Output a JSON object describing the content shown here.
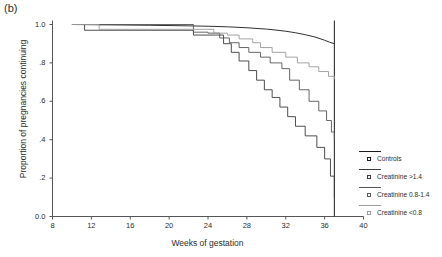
{
  "panel": {
    "label": "(b)"
  },
  "chart_data": {
    "type": "line",
    "title": "",
    "subtitle": "",
    "xlabel": "Weeks of gestation",
    "ylabel": "Proportion of pregnancies continuing",
    "xlim": [
      8,
      40
    ],
    "ylim": [
      0.0,
      1.0
    ],
    "xticks": [
      8,
      12,
      16,
      20,
      24,
      28,
      32,
      36,
      40
    ],
    "xticklabels": [
      "8",
      "12",
      "16",
      "20",
      "24",
      "28",
      "32",
      "36",
      "40"
    ],
    "yticks": [
      0.0,
      0.2,
      0.4,
      0.6,
      0.8,
      1.0
    ],
    "yticklabels": [
      "0.0",
      ".2",
      ".4",
      ".6",
      ".8",
      "1.0"
    ],
    "grid": false,
    "legend_position": "right",
    "annotations": [
      {
        "type": "vline",
        "x": 37.0,
        "label": "term reference line"
      }
    ],
    "series": [
      {
        "name": "Controls",
        "color": "#1a1a1a",
        "style": "smooth-step",
        "x": [
          10.0,
          14.0,
          18.0,
          22.0,
          24.0,
          26.0,
          28.0,
          30.0,
          31.0,
          32.0,
          33.0,
          34.0,
          35.0,
          36.0,
          36.5,
          37.0
        ],
        "y": [
          1.0,
          0.998,
          0.996,
          0.993,
          0.991,
          0.988,
          0.983,
          0.976,
          0.971,
          0.965,
          0.957,
          0.947,
          0.935,
          0.918,
          0.908,
          0.9
        ]
      },
      {
        "name": "Creatinine >1.4",
        "color": "#3a3a3a",
        "style": "step",
        "x": [
          10.0,
          11.3,
          20.0,
          22.5,
          24.8,
          25.6,
          26.4,
          27.2,
          28.2,
          29.0,
          29.8,
          30.6,
          31.4,
          32.2,
          33.0,
          34.0,
          35.2,
          36.0,
          36.6,
          37.0
        ],
        "y": [
          1.0,
          0.97,
          0.97,
          0.945,
          0.945,
          0.9,
          0.855,
          0.81,
          0.76,
          0.71,
          0.66,
          0.62,
          0.57,
          0.52,
          0.47,
          0.42,
          0.36,
          0.3,
          0.21,
          0.1
        ]
      },
      {
        "name": "Creatinine 0.8-1.4",
        "color": "#555555",
        "style": "step",
        "x": [
          10.0,
          20.5,
          22.5,
          24.0,
          25.2,
          26.2,
          27.2,
          28.2,
          29.4,
          30.4,
          31.6,
          32.4,
          33.4,
          34.4,
          35.4,
          36.2,
          36.7,
          37.0
        ],
        "y": [
          1.0,
          1.0,
          0.96,
          0.955,
          0.93,
          0.905,
          0.88,
          0.855,
          0.83,
          0.8,
          0.77,
          0.71,
          0.66,
          0.6,
          0.55,
          0.5,
          0.44,
          0.4
        ]
      },
      {
        "name": "Creatinine <0.8",
        "color": "#9a9a9a",
        "style": "step",
        "x": [
          10.0,
          12.8,
          22.2,
          24.6,
          26.0,
          27.2,
          28.6,
          29.4,
          30.6,
          32.0,
          33.2,
          34.4,
          35.4,
          36.4,
          37.0
        ],
        "y": [
          1.0,
          0.975,
          0.975,
          0.955,
          0.945,
          0.925,
          0.905,
          0.88,
          0.855,
          0.83,
          0.8,
          0.78,
          0.755,
          0.73,
          0.715
        ]
      }
    ],
    "legend_entries": [
      {
        "label": "Controls",
        "color": "#1a1a1a"
      },
      {
        "label": "Creatinine >1.4",
        "color": "#3a3a3a"
      },
      {
        "label": "Creatinine 0.8-1.4",
        "color": "#555555"
      },
      {
        "label": "Creatinine <0.8",
        "color": "#9a9a9a"
      }
    ]
  }
}
